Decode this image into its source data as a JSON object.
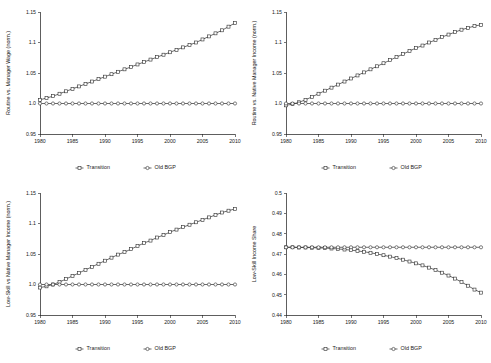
{
  "figure": {
    "layout": "2x2-grid",
    "background_color": "#ffffff",
    "line_color": "#2b2b2b",
    "text_color": "#1a1a1a"
  },
  "legend": {
    "transition_label": "Transition",
    "old_bgp_label": "Old BGP",
    "transition_marker": "square-marker",
    "old_bgp_marker": "circle-marker",
    "position": "below-axes"
  },
  "chart_data": [
    {
      "id": "routine-vs-manager-wage",
      "type": "line",
      "title": "",
      "xlabel": "",
      "ylabel": "Routine vs. Manager Wage (norm.)",
      "xlim": [
        1980,
        2010
      ],
      "ylim": [
        0.95,
        1.15
      ],
      "xticks": [
        1980,
        1985,
        1990,
        1995,
        2000,
        2005,
        2010
      ],
      "xticklabels": [
        "1980",
        "1985",
        "1990",
        "1995",
        "2000",
        "2005",
        "2010"
      ],
      "yticks": [
        0.95,
        1.0,
        1.05,
        1.1,
        1.15
      ],
      "yticklabels": [
        "0.95",
        "1.0",
        "1.05",
        "1.1",
        "1.15"
      ],
      "grid": false,
      "x": [
        1980,
        1981,
        1982,
        1983,
        1984,
        1985,
        1986,
        1987,
        1988,
        1989,
        1990,
        1991,
        1992,
        1993,
        1994,
        1995,
        1996,
        1997,
        1998,
        1999,
        2000,
        2001,
        2002,
        2003,
        2004,
        2005,
        2006,
        2007,
        2008,
        2009,
        2010
      ],
      "series": [
        {
          "name": "Transition",
          "marker": "square",
          "values": [
            1.006,
            1.009,
            1.012,
            1.016,
            1.02,
            1.024,
            1.028,
            1.032,
            1.036,
            1.04,
            1.044,
            1.048,
            1.052,
            1.056,
            1.06,
            1.064,
            1.068,
            1.072,
            1.076,
            1.08,
            1.084,
            1.088,
            1.092,
            1.096,
            1.1,
            1.105,
            1.11,
            1.115,
            1.12,
            1.126,
            1.132
          ]
        },
        {
          "name": "Old BGP",
          "marker": "circle",
          "values": [
            1.0,
            1.0,
            1.0,
            1.0,
            1.0,
            1.0,
            1.0,
            1.0,
            1.0,
            1.0,
            1.0,
            1.0,
            1.0,
            1.0,
            1.0,
            1.0,
            1.0,
            1.0,
            1.0,
            1.0,
            1.0,
            1.0,
            1.0,
            1.0,
            1.0,
            1.0,
            1.0,
            1.0,
            1.0,
            1.0,
            1.0
          ]
        }
      ]
    },
    {
      "id": "routine-vs-native-manager-income",
      "type": "line",
      "title": "",
      "xlabel": "",
      "ylabel": "Routine vs. Native Manager Income (norm.)",
      "xlim": [
        1980,
        2010
      ],
      "ylim": [
        0.95,
        1.15
      ],
      "xticks": [
        1980,
        1985,
        1990,
        1995,
        2000,
        2005,
        2010
      ],
      "xticklabels": [
        "1980",
        "1985",
        "1990",
        "1995",
        "2000",
        "2005",
        "2010"
      ],
      "yticks": [
        0.95,
        1.0,
        1.05,
        1.1,
        1.15
      ],
      "yticklabels": [
        "0.95",
        "1.0",
        "1.05",
        "1.1",
        "1.15"
      ],
      "grid": false,
      "x": [
        1980,
        1981,
        1982,
        1983,
        1984,
        1985,
        1986,
        1987,
        1988,
        1989,
        1990,
        1991,
        1992,
        1993,
        1994,
        1995,
        1996,
        1997,
        1998,
        1999,
        2000,
        2001,
        2002,
        2003,
        2004,
        2005,
        2006,
        2007,
        2008,
        2009,
        2010
      ],
      "series": [
        {
          "name": "Transition",
          "marker": "square",
          "values": [
            0.997,
            0.999,
            1.002,
            1.006,
            1.011,
            1.016,
            1.021,
            1.026,
            1.031,
            1.036,
            1.041,
            1.046,
            1.051,
            1.056,
            1.061,
            1.066,
            1.071,
            1.076,
            1.081,
            1.086,
            1.091,
            1.095,
            1.1,
            1.104,
            1.109,
            1.113,
            1.117,
            1.121,
            1.124,
            1.127,
            1.129
          ]
        },
        {
          "name": "Old BGP",
          "marker": "circle",
          "values": [
            1.0,
            1.0,
            1.0,
            1.0,
            1.0,
            1.0,
            1.0,
            1.0,
            1.0,
            1.0,
            1.0,
            1.0,
            1.0,
            1.0,
            1.0,
            1.0,
            1.0,
            1.0,
            1.0,
            1.0,
            1.0,
            1.0,
            1.0,
            1.0,
            1.0,
            1.0,
            1.0,
            1.0,
            1.0,
            1.0,
            1.0
          ]
        }
      ]
    },
    {
      "id": "low-skill-vs-native-manager-income",
      "type": "line",
      "title": "",
      "xlabel": "",
      "ylabel": "Low-Skill vs Native Manager Income (norm.)",
      "xlim": [
        1980,
        2010
      ],
      "ylim": [
        0.95,
        1.15
      ],
      "xticks": [
        1980,
        1985,
        1990,
        1995,
        2000,
        2005,
        2010
      ],
      "xticklabels": [
        "1980",
        "1985",
        "1990",
        "1995",
        "2000",
        "2005",
        "2010"
      ],
      "yticks": [
        0.95,
        1.0,
        1.05,
        1.1,
        1.15
      ],
      "yticklabels": [
        "0.95",
        "1.0",
        "1.05",
        "1.1",
        "1.15"
      ],
      "grid": false,
      "x": [
        1980,
        1981,
        1982,
        1983,
        1984,
        1985,
        1986,
        1987,
        1988,
        1989,
        1990,
        1991,
        1992,
        1993,
        1994,
        1995,
        1996,
        1997,
        1998,
        1999,
        2000,
        2001,
        2002,
        2003,
        2004,
        2005,
        2006,
        2007,
        2008,
        2009,
        2010
      ],
      "series": [
        {
          "name": "Transition",
          "marker": "square",
          "values": [
            0.995,
            0.997,
            1.0,
            1.004,
            1.009,
            1.014,
            1.019,
            1.024,
            1.029,
            1.034,
            1.039,
            1.044,
            1.049,
            1.053,
            1.058,
            1.063,
            1.068,
            1.072,
            1.077,
            1.081,
            1.086,
            1.09,
            1.094,
            1.098,
            1.102,
            1.106,
            1.11,
            1.114,
            1.118,
            1.121,
            1.124
          ]
        },
        {
          "name": "Old BGP",
          "marker": "circle",
          "values": [
            1.0,
            1.0,
            1.0,
            1.0,
            1.0,
            1.0,
            1.0,
            1.0,
            1.0,
            1.0,
            1.0,
            1.0,
            1.0,
            1.0,
            1.0,
            1.0,
            1.0,
            1.0,
            1.0,
            1.0,
            1.0,
            1.0,
            1.0,
            1.0,
            1.0,
            1.0,
            1.0,
            1.0,
            1.0,
            1.0,
            1.0
          ]
        }
      ]
    },
    {
      "id": "low-skill-income-share",
      "type": "line",
      "title": "",
      "xlabel": "",
      "ylabel": "Low-Skill Income Share",
      "xlim": [
        1980,
        2010
      ],
      "ylim": [
        0.44,
        0.5
      ],
      "xticks": [
        1980,
        1985,
        1990,
        1995,
        2000,
        2005,
        2010
      ],
      "xticklabels": [
        "1980",
        "1985",
        "1990",
        "1995",
        "2000",
        "2005",
        "2010"
      ],
      "yticks": [
        0.44,
        0.45,
        0.46,
        0.47,
        0.48,
        0.49,
        0.5
      ],
      "yticklabels": [
        "0.44",
        "0.45",
        "0.46",
        "0.47",
        "0.48",
        "0.49",
        "0.5"
      ],
      "grid": false,
      "x": [
        1980,
        1981,
        1982,
        1983,
        1984,
        1985,
        1986,
        1987,
        1988,
        1989,
        1990,
        1991,
        1992,
        1993,
        1994,
        1995,
        1996,
        1997,
        1998,
        1999,
        2000,
        2001,
        2002,
        2003,
        2004,
        2005,
        2006,
        2007,
        2008,
        2009,
        2010
      ],
      "series": [
        {
          "name": "Transition",
          "marker": "square",
          "values": [
            0.4733,
            0.4733,
            0.4732,
            0.4732,
            0.4731,
            0.473,
            0.4729,
            0.4727,
            0.4725,
            0.4722,
            0.4719,
            0.4715,
            0.4711,
            0.4706,
            0.47,
            0.4694,
            0.4687,
            0.468,
            0.4672,
            0.4663,
            0.4654,
            0.4644,
            0.4633,
            0.4621,
            0.4608,
            0.4594,
            0.4579,
            0.4562,
            0.4544,
            0.4525,
            0.451
          ]
        },
        {
          "name": "Old BGP",
          "marker": "circle",
          "values": [
            0.4733,
            0.4733,
            0.4733,
            0.4733,
            0.4733,
            0.4733,
            0.4733,
            0.4733,
            0.4733,
            0.4733,
            0.4733,
            0.4733,
            0.4733,
            0.4733,
            0.4733,
            0.4733,
            0.4733,
            0.4733,
            0.4733,
            0.4733,
            0.4733,
            0.4733,
            0.4733,
            0.4733,
            0.4733,
            0.4733,
            0.4733,
            0.4733,
            0.4733,
            0.4733,
            0.4733
          ]
        }
      ]
    }
  ]
}
